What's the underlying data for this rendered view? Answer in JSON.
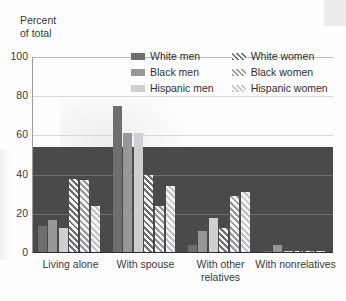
{
  "axis": {
    "y_title": "Percent\nof total",
    "y_ticks": [
      "100",
      "80",
      "60",
      "40",
      "20",
      "0"
    ]
  },
  "legend": {
    "items": [
      {
        "label": "White men",
        "key": "white_men",
        "color": "#6e6e70",
        "hatched": false
      },
      {
        "label": "White women",
        "key": "white_women",
        "color": "#6e6e70",
        "hatched": true
      },
      {
        "label": "Black men",
        "key": "black_men",
        "color": "#97979a",
        "hatched": false
      },
      {
        "label": "Black women",
        "key": "black_women",
        "color": "#97979a",
        "hatched": true
      },
      {
        "label": "Hispanic men",
        "key": "hispanic_men",
        "color": "#cfcfd1",
        "hatched": false
      },
      {
        "label": "Hispanic women",
        "key": "hispanic_women",
        "color": "#c2c2c4",
        "hatched": true
      }
    ]
  },
  "chart_data": {
    "type": "bar",
    "title": "",
    "xlabel": "",
    "ylabel": "Percent of total",
    "ylim": [
      0,
      100
    ],
    "yticks": [
      0,
      20,
      40,
      60,
      80,
      100
    ],
    "grid": true,
    "legend_position": "top-center",
    "categories": [
      "Living alone",
      "With spouse",
      "With other relatives",
      "With nonrelatives"
    ],
    "series": [
      {
        "name": "White men",
        "values": [
          14,
          75,
          4,
          1
        ]
      },
      {
        "name": "Black men",
        "values": [
          17,
          61,
          11,
          4
        ]
      },
      {
        "name": "Hispanic men",
        "values": [
          13,
          61,
          18,
          1
        ]
      },
      {
        "name": "White women",
        "values": [
          38,
          40,
          13,
          1
        ]
      },
      {
        "name": "Black women",
        "values": [
          37,
          24,
          29,
          1
        ]
      },
      {
        "name": "Hispanic women",
        "values": [
          24,
          34,
          31,
          1
        ]
      }
    ]
  }
}
